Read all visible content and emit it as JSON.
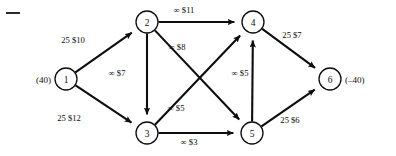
{
  "figure": {
    "type": "network-flow-diagram",
    "title": "",
    "background_color": "#ffffff",
    "ink_color": "#0d0d0d",
    "width": 396,
    "height": 156
  },
  "chart_data": {
    "type": "diagram",
    "subtype": "directed-network-flow-graph",
    "title": "",
    "xlabel": "",
    "ylabel": "",
    "nodes": [
      {
        "id": "1",
        "label": "1",
        "x": 66,
        "y": 79,
        "r": 11,
        "side_label": "(40)",
        "side": "left",
        "supply": 40
      },
      {
        "id": "2",
        "label": "2",
        "x": 147,
        "y": 22,
        "r": 11,
        "side_label": "",
        "side": "",
        "supply": 0
      },
      {
        "id": "3",
        "label": "3",
        "x": 147,
        "y": 133,
        "r": 11,
        "side_label": "",
        "side": "",
        "supply": 0
      },
      {
        "id": "4",
        "label": "4",
        "x": 253,
        "y": 22,
        "r": 11,
        "side_label": "",
        "side": "",
        "supply": 0
      },
      {
        "id": "5",
        "label": "5",
        "x": 252,
        "y": 133,
        "r": 11,
        "side_label": "",
        "side": "",
        "supply": 0
      },
      {
        "id": "6",
        "label": "6",
        "x": 330,
        "y": 79,
        "r": 11,
        "side_label": "(–40)",
        "side": "right",
        "supply": -40
      }
    ],
    "edges": [
      {
        "from": "1",
        "to": "2",
        "capacity": "25",
        "cost": "$10",
        "label": "25 $10",
        "label_x": 73,
        "label_y": 40
      },
      {
        "from": "1",
        "to": "3",
        "capacity": "25",
        "cost": "$12",
        "label": "25 $12",
        "label_x": 69,
        "label_y": 118
      },
      {
        "from": "2",
        "to": "4",
        "capacity": "∞",
        "cost": "$11",
        "label": "∞ $11",
        "label_x": 184,
        "label_y": 10
      },
      {
        "from": "2",
        "to": "3",
        "capacity": "∞",
        "cost": "$7",
        "label": "∞ $7",
        "label_x": 117,
        "label_y": 73
      },
      {
        "from": "2",
        "to": "5",
        "capacity": "∞",
        "cost": "$8",
        "label": "∞ $8",
        "label_x": 177,
        "label_y": 47
      },
      {
        "from": "3",
        "to": "4",
        "capacity": "∞",
        "cost": "$5",
        "label": "∞ $5",
        "label_x": 176,
        "label_y": 108
      },
      {
        "from": "3",
        "to": "5",
        "capacity": "∞",
        "cost": "$3",
        "label": "∞ $3",
        "label_x": 189,
        "label_y": 142
      },
      {
        "from": "5",
        "to": "4",
        "capacity": "∞",
        "cost": "$5",
        "label": "∞ $5",
        "label_x": 240,
        "label_y": 73
      },
      {
        "from": "4",
        "to": "6",
        "capacity": "25",
        "cost": "$7",
        "label": "25 $7",
        "label_x": 292,
        "label_y": 35
      },
      {
        "from": "5",
        "to": "6",
        "capacity": "25",
        "cost": "$6",
        "label": "25 $6",
        "label_x": 290,
        "label_y": 120
      }
    ],
    "legend": [],
    "annotations": [
      {
        "name": "scan-corner-mark",
        "x": 6,
        "y": 12,
        "width": 14,
        "height": 2
      }
    ]
  }
}
